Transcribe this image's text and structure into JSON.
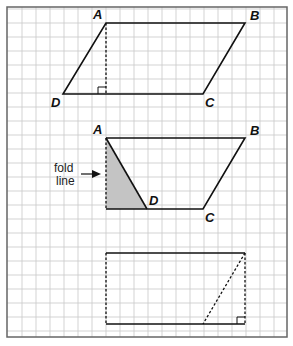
{
  "diagram": {
    "frame": {
      "x": 7,
      "y": 7,
      "width": 280,
      "height": 330,
      "grid_spacing": 14,
      "grid_color": "#c8c8c8",
      "frame_color": "#666666"
    },
    "figures": [
      {
        "id": "parallelogram",
        "vertices": {
          "A": [
            106,
            23
          ],
          "B": [
            245,
            23
          ],
          "C": [
            203,
            94
          ],
          "D": [
            63,
            94
          ]
        },
        "labels": {
          "A": "A",
          "B": "B",
          "C": "C",
          "D": "D"
        },
        "height_line": {
          "from": [
            106,
            23
          ],
          "to": [
            106,
            94
          ],
          "style": "dashed"
        },
        "right_angle": true
      },
      {
        "id": "folded-trapezoid",
        "vertices": {
          "A": [
            106,
            138
          ],
          "B": [
            245,
            138
          ],
          "C": [
            203,
            209
          ],
          "D": [
            147,
            209
          ]
        },
        "labels": {
          "A": "A",
          "B": "B",
          "C": "C",
          "D": "D"
        },
        "shaded_triangle": {
          "points": [
            [
              106,
              138
            ],
            [
              106,
              209
            ],
            [
              147,
              209
            ]
          ],
          "fill": "#c4c4c4"
        },
        "fold_label_line1": "fold",
        "fold_label_line2": "line"
      },
      {
        "id": "rectangle",
        "corners": {
          "top_left": [
            106,
            253
          ],
          "top_right": [
            245,
            253
          ],
          "bottom_right": [
            245,
            324
          ],
          "bottom_left": [
            106,
            324
          ]
        },
        "diagonal": {
          "from": [
            245,
            253
          ],
          "to": [
            203,
            324
          ],
          "style": "dashed"
        },
        "right_angle": true
      }
    ]
  }
}
